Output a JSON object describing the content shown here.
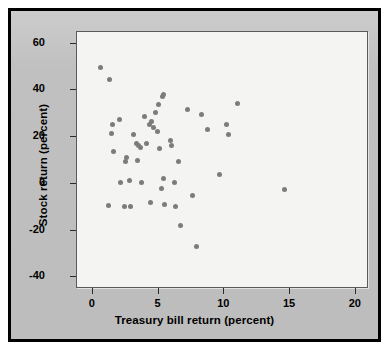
{
  "figure": {
    "panel_color": "#c2c2c2",
    "plot_background": "#f4f4f2",
    "border_color": "#000000",
    "marker_color": "#7c7c7c"
  },
  "chart_data": {
    "type": "scatter",
    "title": "",
    "xlabel": "Treasury bill return (percent)",
    "ylabel": "Stock return (percent)",
    "xlim": [
      -1.2,
      21.0
    ],
    "ylim": [
      -45.0,
      65.0
    ],
    "xticks": [
      0,
      5,
      10,
      15,
      20
    ],
    "xtick_labels": [
      "0",
      "5",
      "10",
      "15",
      "20"
    ],
    "yticks": [
      60,
      40,
      20,
      0,
      -20,
      -40
    ],
    "ytick_labels": [
      "60",
      "40",
      "20",
      "0",
      "-20",
      "-40"
    ],
    "grid": false,
    "legend": null,
    "marker": "circle",
    "n_points": 56,
    "series": [
      {
        "name": "Annual returns",
        "points": [
          [
            0.6,
            50.0
          ],
          [
            1.3,
            44.5
          ],
          [
            1.5,
            25.5
          ],
          [
            1.4,
            21.5
          ],
          [
            1.6,
            13.8
          ],
          [
            1.2,
            -9.4
          ],
          [
            2.0,
            27.5
          ],
          [
            2.1,
            0.5
          ],
          [
            2.5,
            9.5
          ],
          [
            2.6,
            11.5
          ],
          [
            2.4,
            -9.8
          ],
          [
            2.8,
            1.3
          ],
          [
            2.9,
            -9.8
          ],
          [
            3.1,
            21.3
          ],
          [
            3.3,
            17.2
          ],
          [
            3.4,
            9.9
          ],
          [
            3.6,
            15.5
          ],
          [
            3.5,
            16.6
          ],
          [
            3.7,
            0.4
          ],
          [
            3.9,
            29.0
          ],
          [
            4.1,
            17.1
          ],
          [
            4.3,
            25.3
          ],
          [
            4.5,
            26.8
          ],
          [
            4.6,
            24.3
          ],
          [
            4.4,
            -7.9
          ],
          [
            4.8,
            30.5
          ],
          [
            4.9,
            22.4
          ],
          [
            5.0,
            33.9
          ],
          [
            5.1,
            15.2
          ],
          [
            5.2,
            -1.9
          ],
          [
            5.3,
            37.6
          ],
          [
            5.35,
            38.3
          ],
          [
            5.4,
            2.3
          ],
          [
            5.45,
            -8.9
          ],
          [
            5.9,
            18.4
          ],
          [
            6.0,
            16.5
          ],
          [
            6.2,
            0.6
          ],
          [
            6.3,
            -9.8
          ],
          [
            6.5,
            9.7
          ],
          [
            6.7,
            -18.0
          ],
          [
            7.2,
            32.0
          ],
          [
            7.6,
            -5.1
          ],
          [
            7.9,
            -26.8
          ],
          [
            8.3,
            29.5
          ],
          [
            8.7,
            23.3
          ],
          [
            9.6,
            4.2
          ],
          [
            10.2,
            25.6
          ],
          [
            10.3,
            21.3
          ],
          [
            11.0,
            34.2
          ],
          [
            14.6,
            -2.4
          ]
        ]
      }
    ]
  }
}
